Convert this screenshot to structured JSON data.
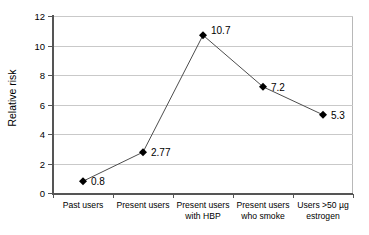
{
  "chart_data": {
    "type": "line",
    "title": "",
    "xlabel": "",
    "ylabel": "Relative risk",
    "ylim": [
      0,
      12
    ],
    "yticks": [
      0,
      2,
      4,
      6,
      8,
      10,
      12
    ],
    "ytick_labels": [
      "0",
      "2",
      "4",
      "6",
      "8",
      "10",
      "12"
    ],
    "grid": true,
    "legend": "none",
    "marker": "diamond",
    "marker_color": "#000000",
    "line_color": "#4d4d4d",
    "gridline_color": "#c9c9c9",
    "axis_color": "#555555",
    "background": "#ffffff",
    "categories": [
      "Past users",
      "Present users",
      "Present users with HBP",
      "Present users who smoke",
      "Users >50 µg estrogen"
    ],
    "category_lines": [
      [
        "Past users"
      ],
      [
        "Present users"
      ],
      [
        "Present users",
        "with HBP"
      ],
      [
        "Present users",
        "who smoke"
      ],
      [
        "Users >50 µg",
        "estrogen"
      ]
    ],
    "values": [
      0.8,
      2.77,
      10.7,
      7.2,
      5.3
    ],
    "data_labels": [
      "0.8",
      "2.77",
      "10.7",
      "7.2",
      "5.3"
    ]
  }
}
